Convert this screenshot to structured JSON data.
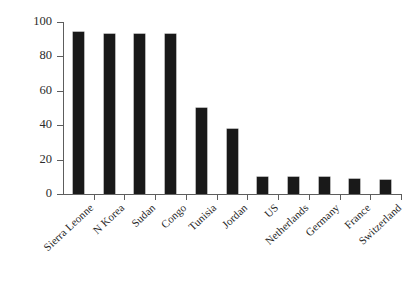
{
  "chart_data": {
    "type": "bar",
    "title": "",
    "subtitle": "",
    "xlabel": "",
    "ylabel": "",
    "ylim": [
      0,
      100
    ],
    "yticks": [
      "0",
      "20",
      "40",
      "60",
      "80",
      "100"
    ],
    "grid": false,
    "legend": null,
    "bar_color": "#191919",
    "axis_color": "#5d5d5d",
    "background": "#ffffff",
    "categories": [
      "Sierra Leonne",
      "N Korea",
      "Sudan",
      "Congo",
      "Tunisia",
      "Jordan",
      "US",
      "Netherlands",
      "Germany",
      "France",
      "Switzerland"
    ],
    "values": [
      94,
      93,
      93,
      93,
      50,
      38,
      10,
      10,
      10,
      9,
      8
    ]
  }
}
